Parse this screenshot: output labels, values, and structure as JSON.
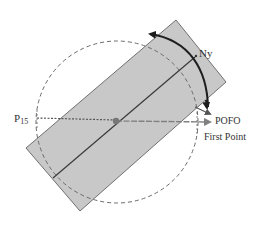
{
  "labels": {
    "ny": "Ny",
    "p15_main": "P",
    "p15_sub": "15",
    "pofo": "POFO",
    "first_point": "First Point"
  },
  "colors": {
    "rect_fill": "#c8c8c8",
    "rect_stroke": "#707070",
    "axis_line": "#3a3a3a",
    "circle_dash": "#6a6a6a",
    "arc_arrow": "#1e1e1e",
    "first_point_arrow": "#808080",
    "center_dot": "#777777",
    "text": "#333333"
  }
}
